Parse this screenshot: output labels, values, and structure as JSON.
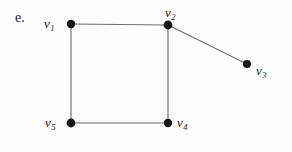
{
  "figure": {
    "item_letter": "e.",
    "background_color": "#fdfdfd",
    "edge_color": "#6e6e6e",
    "node_color": "#161616",
    "label_color": "#1b1b1b",
    "width": 292,
    "height": 152
  },
  "graph": {
    "type": "undirected-graph",
    "node_radius": 4.2,
    "edge_width": 1.1,
    "nodes": [
      {
        "id": "v1",
        "label_v": "v",
        "label_sub": "1",
        "x": 71,
        "y": 24
      },
      {
        "id": "v2",
        "label_v": "v",
        "label_sub": "2",
        "x": 168,
        "y": 25
      },
      {
        "id": "v3",
        "label_v": "v",
        "label_sub": "3",
        "x": 247,
        "y": 64
      },
      {
        "id": "v4",
        "label_v": "v",
        "label_sub": "4",
        "x": 168,
        "y": 123
      },
      {
        "id": "v5",
        "label_v": "v",
        "label_sub": "5",
        "x": 71,
        "y": 123
      }
    ],
    "edges": [
      {
        "from": "v1",
        "to": "v2",
        "x1": 71,
        "y1": 24,
        "x2": 168,
        "y2": 25
      },
      {
        "from": "v2",
        "to": "v3",
        "x1": 168,
        "y1": 25,
        "x2": 247,
        "y2": 64
      },
      {
        "from": "v2",
        "to": "v4",
        "x1": 168,
        "y1": 25,
        "x2": 168,
        "y2": 123
      },
      {
        "from": "v4",
        "to": "v5",
        "x1": 168,
        "y1": 123,
        "x2": 71,
        "y2": 123
      },
      {
        "from": "v5",
        "to": "v1",
        "x1": 71,
        "y1": 123,
        "x2": 71,
        "y2": 24
      }
    ]
  }
}
